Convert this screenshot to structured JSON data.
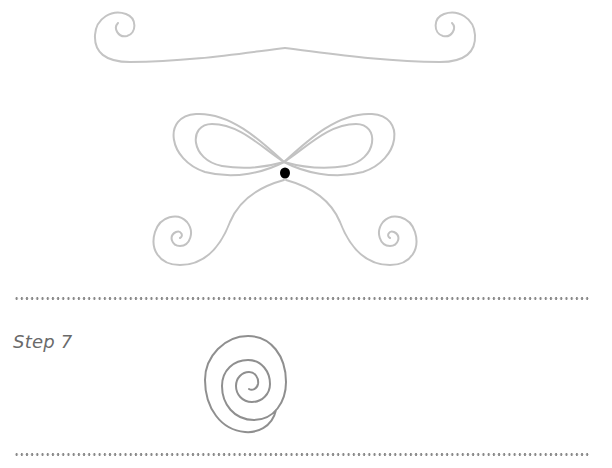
{
  "page": {
    "steps": [
      {
        "label": "Step 7"
      }
    ]
  },
  "colors": {
    "stroke_light": "#c2c2c2",
    "stroke_dark": "#8f8f8f",
    "dot": "#000000",
    "label": "#6a6a6a",
    "divider": "#8a8a8a"
  },
  "figures": {
    "mustache_scroll": "mustache-scroll-figure",
    "bow_with_spirals": "bow-with-spirals-figure",
    "spiral": "spiral-figure"
  }
}
